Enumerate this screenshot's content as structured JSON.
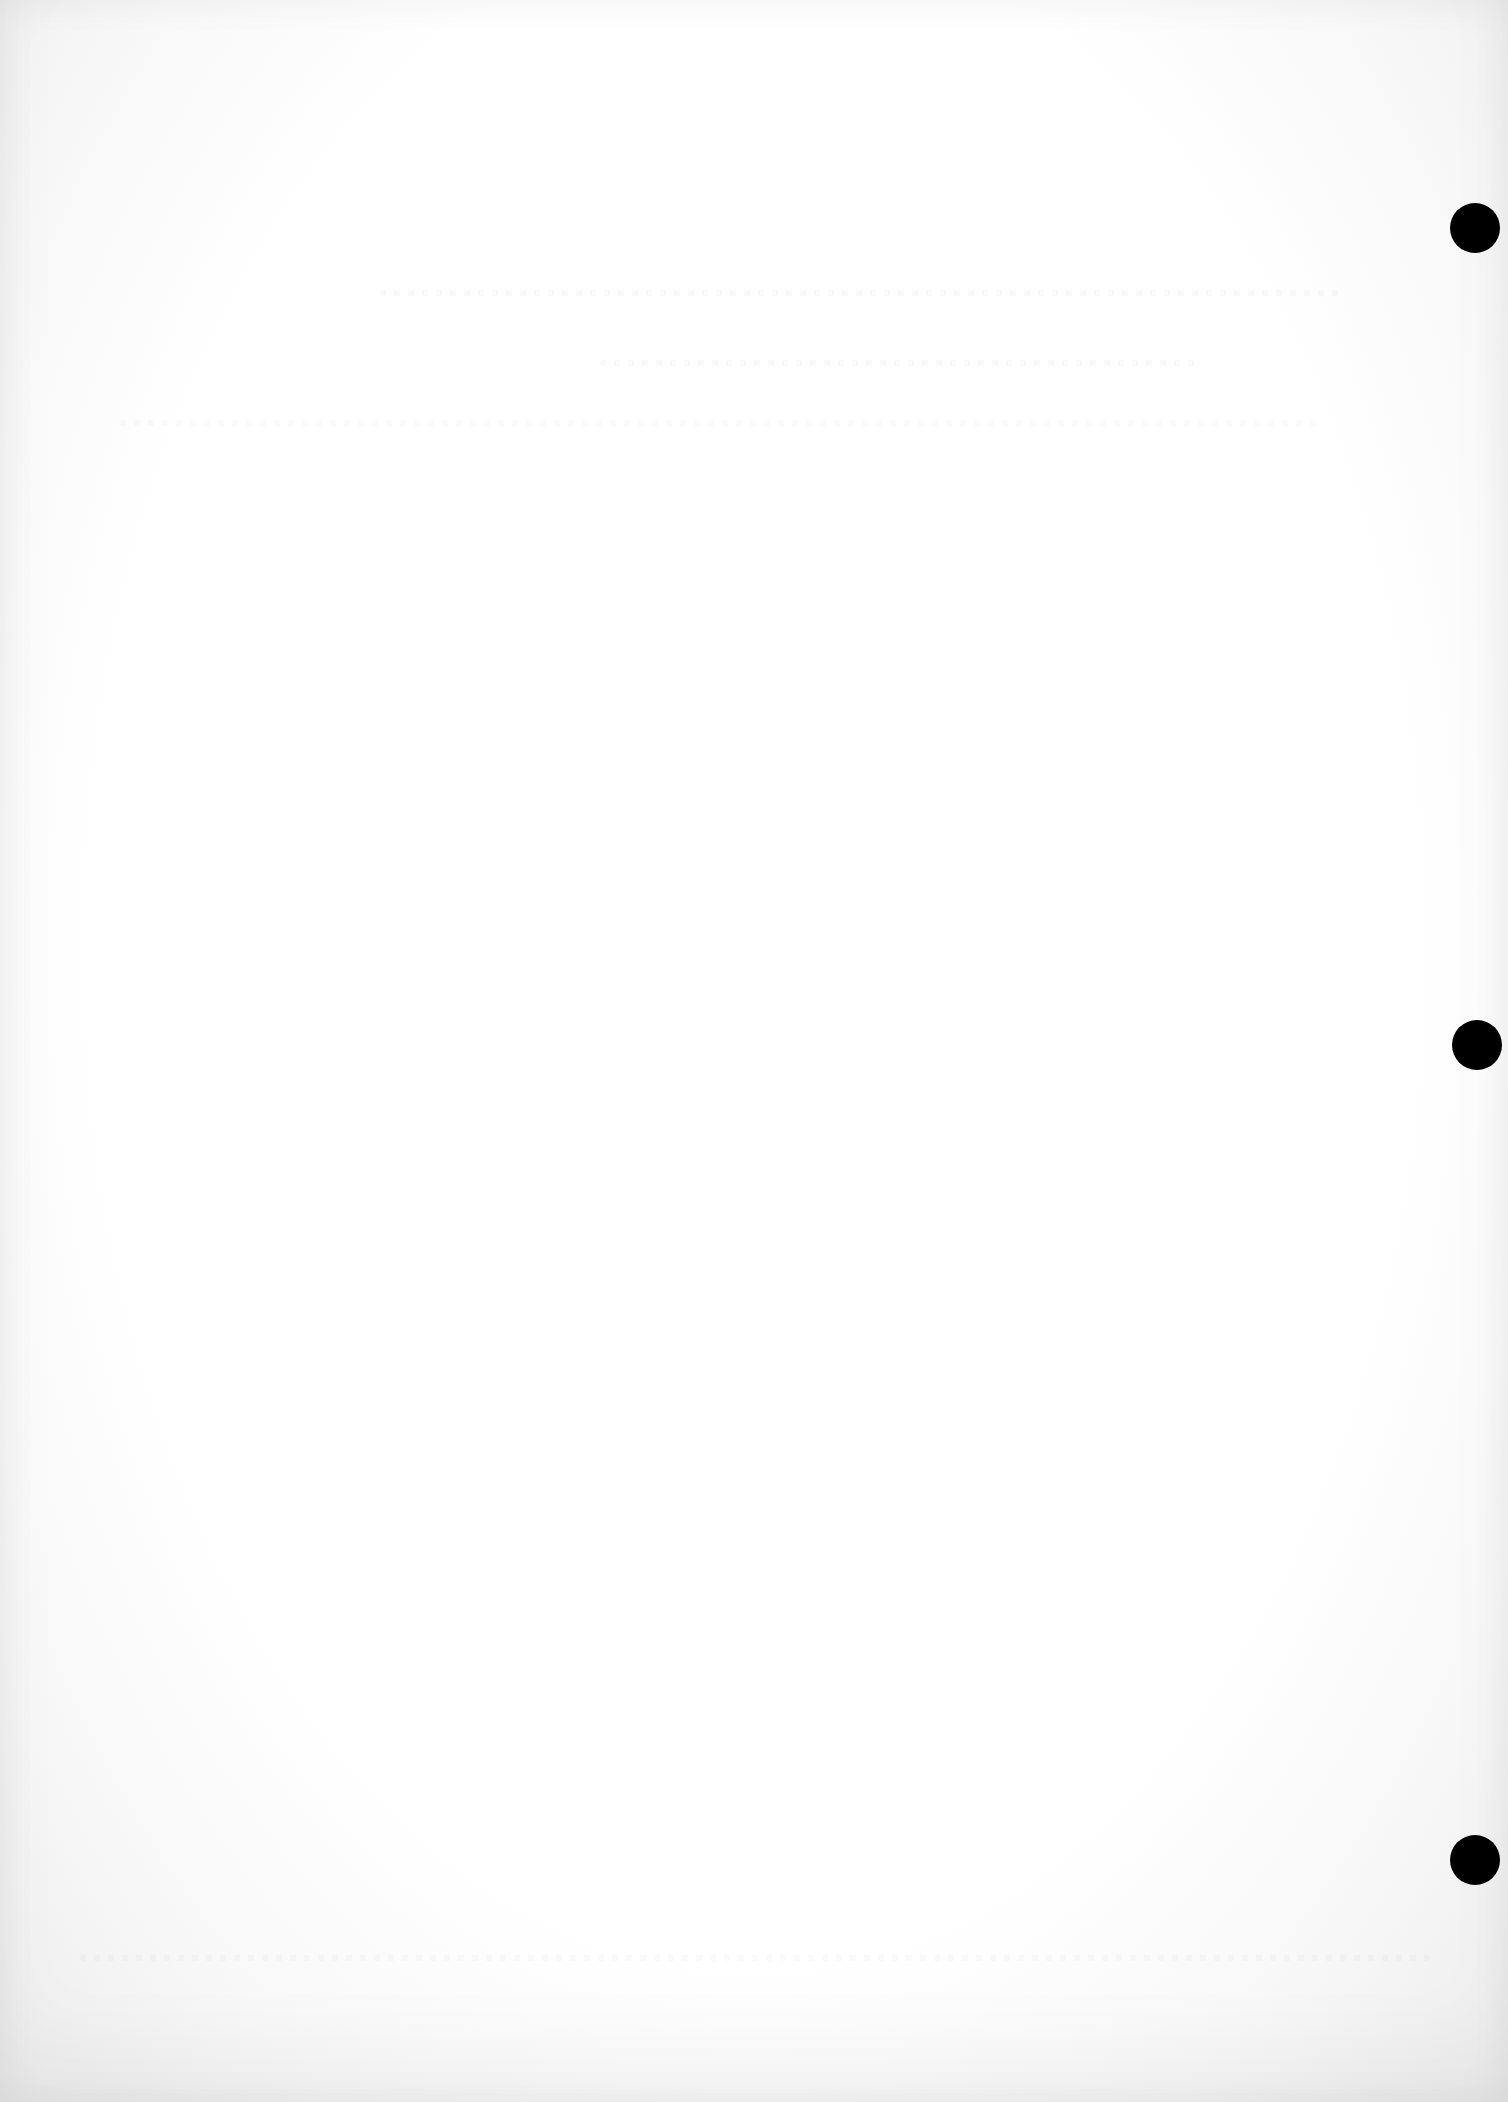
{
  "document": {
    "type": "blank scanned sheet",
    "text_content": "",
    "paper_color": "#ffffff",
    "edge_tint": "#ececec"
  },
  "punch_holes": [
    {
      "name": "top",
      "cx": 1475,
      "cy": 228,
      "r": 25,
      "color": "#000000"
    },
    {
      "name": "middle",
      "cx": 1477,
      "cy": 1045,
      "r": 25,
      "color": "#000000"
    },
    {
      "name": "bottom",
      "cx": 1475,
      "cy": 1860,
      "r": 25,
      "color": "#000000"
    }
  ],
  "bleed_through_regions": [
    {
      "x": 380,
      "y": 290,
      "w": 960,
      "label": ""
    },
    {
      "x": 600,
      "y": 360,
      "w": 600,
      "label": ""
    },
    {
      "x": 120,
      "y": 420,
      "w": 1200,
      "label": ""
    },
    {
      "x": 80,
      "y": 1955,
      "w": 1350,
      "label": ""
    }
  ]
}
